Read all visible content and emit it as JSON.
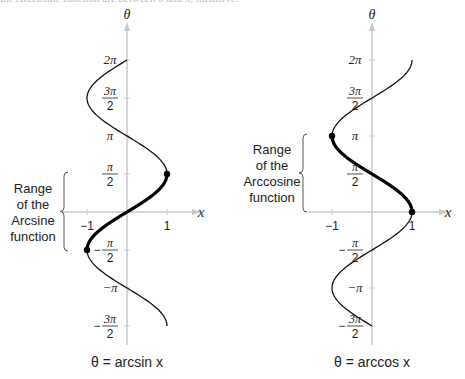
{
  "header_text_cropped": "the Arccosine function are between 0 and π, inclusive.",
  "chart_data": [
    {
      "type": "line",
      "title": "θ = arcsin x",
      "xlabel": "x",
      "ylabel": "θ",
      "xlim": [
        -1,
        1
      ],
      "ylim": [
        "-3π/2",
        "2π"
      ],
      "x_ticks": [
        {
          "value": -1,
          "label": "−1"
        },
        {
          "value": 1,
          "label": "1"
        }
      ],
      "y_ticks": [
        {
          "value": 6.2832,
          "label": "2π",
          "frac": false
        },
        {
          "value": 4.7124,
          "num": "3π",
          "den": "2",
          "frac": true
        },
        {
          "value": 3.1416,
          "label": "π",
          "frac": false
        },
        {
          "value": 1.5708,
          "num": "π",
          "den": "2",
          "frac": true
        },
        {
          "value": -1.5708,
          "num": "π",
          "den": "2",
          "frac": true,
          "neg": true
        },
        {
          "value": -3.1416,
          "label": "−π",
          "frac": false
        },
        {
          "value": -4.7124,
          "num": "3π",
          "den": "2",
          "frac": true,
          "neg": true
        }
      ],
      "curve": "x = sin(θ)",
      "theta_range": [
        -4.7124,
        6.2832
      ],
      "highlight_range": [
        -1.5708,
        1.5708
      ],
      "highlight_endpoints": [
        [
          -1,
          -1.5708
        ],
        [
          1,
          1.5708
        ]
      ],
      "annotation": {
        "lines": [
          "Range",
          "of the",
          "Arcsine",
          "function"
        ],
        "side": "left"
      },
      "caption": "θ  =  arcsin x"
    },
    {
      "type": "line",
      "title": "θ = arccos x",
      "xlabel": "x",
      "ylabel": "θ",
      "xlim": [
        -1,
        1
      ],
      "ylim": [
        "-3π/2",
        "2π"
      ],
      "x_ticks": [
        {
          "value": -1,
          "label": "−1"
        },
        {
          "value": 1,
          "label": "1"
        }
      ],
      "y_ticks": [
        {
          "value": 6.2832,
          "label": "2π",
          "frac": false
        },
        {
          "value": 4.7124,
          "num": "3π",
          "den": "2",
          "frac": true
        },
        {
          "value": 3.1416,
          "label": "π",
          "frac": false
        },
        {
          "value": 1.5708,
          "num": "π",
          "den": "2",
          "frac": true
        },
        {
          "value": -1.5708,
          "num": "π",
          "den": "2",
          "frac": true,
          "neg": true
        },
        {
          "value": -3.1416,
          "label": "−π",
          "frac": false
        },
        {
          "value": -4.7124,
          "num": "3π",
          "den": "2",
          "frac": true,
          "neg": true
        }
      ],
      "curve": "x = cos(θ)",
      "theta_range": [
        -4.7124,
        6.2832
      ],
      "highlight_range": [
        0,
        3.1416
      ],
      "highlight_endpoints": [
        [
          1,
          0
        ],
        [
          -1,
          3.1416
        ]
      ],
      "annotation": {
        "lines": [
          "Range",
          "of the",
          "Arccosine",
          "function"
        ],
        "side": "left"
      },
      "caption": "θ  =  arccos x"
    }
  ]
}
